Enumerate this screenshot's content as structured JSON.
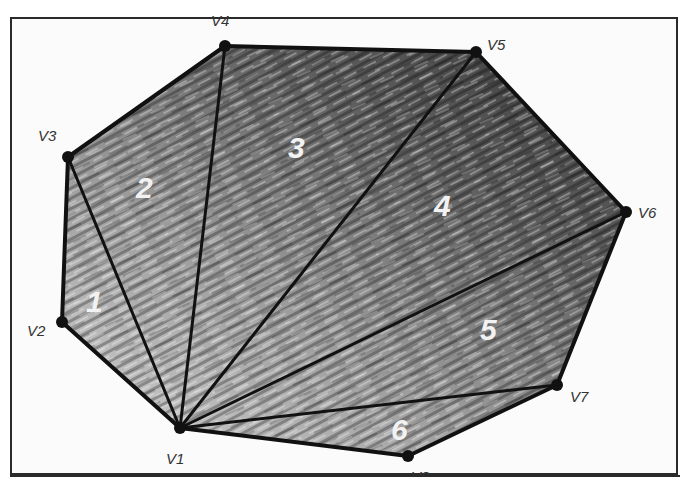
{
  "diagram": {
    "type": "polygon-fan-triangulation",
    "colors": {
      "edge": "#111111",
      "vertex": "#111111",
      "frame": "#2a2a2a",
      "fill_dark": "#3a3a3a",
      "fill_light": "#c8c8c8",
      "region_label": "#f2f2f2",
      "vertex_label": "#333333"
    },
    "vertices": [
      {
        "id": "V1",
        "label": "V1",
        "x": 180,
        "y": 428
      },
      {
        "id": "V2",
        "label": "V2",
        "x": 62,
        "y": 322
      },
      {
        "id": "V3",
        "label": "V3",
        "x": 68,
        "y": 157
      },
      {
        "id": "V4",
        "label": "V4",
        "x": 225,
        "y": 46
      },
      {
        "id": "V5",
        "label": "V5",
        "x": 476,
        "y": 52
      },
      {
        "id": "V6",
        "label": "V6",
        "x": 626,
        "y": 212
      },
      {
        "id": "V7",
        "label": "V7",
        "x": 557,
        "y": 385
      },
      {
        "id": "V8",
        "label": "V8",
        "x": 408,
        "y": 456
      }
    ],
    "diagonals": [
      [
        "V1",
        "V3"
      ],
      [
        "V1",
        "V4"
      ],
      [
        "V1",
        "V5"
      ],
      [
        "V1",
        "V6"
      ],
      [
        "V1",
        "V7"
      ]
    ],
    "regions": [
      {
        "label": "1",
        "vertices": [
          "V1",
          "V2",
          "V3"
        ]
      },
      {
        "label": "2",
        "vertices": [
          "V1",
          "V3",
          "V4"
        ]
      },
      {
        "label": "3",
        "vertices": [
          "V1",
          "V4",
          "V5"
        ]
      },
      {
        "label": "4",
        "vertices": [
          "V1",
          "V5",
          "V6"
        ]
      },
      {
        "label": "5",
        "vertices": [
          "V1",
          "V6",
          "V7"
        ]
      },
      {
        "label": "6",
        "vertices": [
          "V1",
          "V7",
          "V8"
        ]
      }
    ]
  }
}
